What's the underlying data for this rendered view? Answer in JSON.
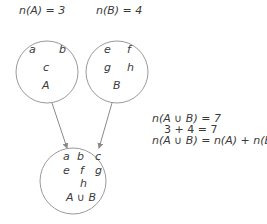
{
  "header": {
    "count_a": "n(A) = 3",
    "count_b": "n(B) = 4"
  },
  "sets": {
    "A": {
      "label": "A",
      "elements": [
        "a",
        "b",
        "c"
      ]
    },
    "B": {
      "label": "B",
      "elements": [
        "e",
        "f",
        "g",
        "h"
      ]
    },
    "union": {
      "label": "A ∪ B",
      "elements": [
        "a",
        "b",
        "c",
        "e",
        "f",
        "g",
        "h"
      ]
    }
  },
  "equations": [
    "n(A ∪ B) = 7",
    "3 + 4 = 7",
    "n(A ∪ B) = n(A) + n(B)"
  ],
  "colors": {
    "stroke": "#9a9a9a",
    "text": "#3a3a3a"
  }
}
